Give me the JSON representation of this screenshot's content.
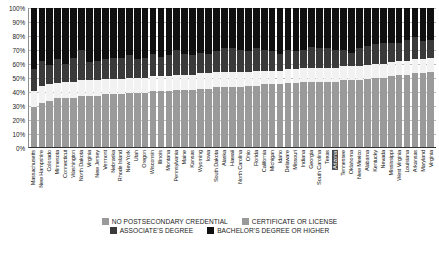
{
  "chart_data": {
    "type": "bar",
    "subtype": "100% stacked column",
    "title": "",
    "xlabel": "",
    "ylabel": "",
    "ylim": [
      0,
      100
    ],
    "ytick_labels": [
      "100%",
      "90%",
      "80%",
      "70%",
      "60%",
      "50%",
      "40%",
      "30%",
      "20%",
      "10%",
      "0%"
    ],
    "ytick_values": [
      100,
      90,
      80,
      70,
      60,
      50,
      40,
      30,
      20,
      10,
      0
    ],
    "grid": true,
    "legend_position": "bottom",
    "highlighted_category": "Arizona",
    "series": [
      {
        "name": "BACHELOR'S DEGREE OR HIGHER",
        "color": "#101010",
        "values": [
          44,
          38,
          41,
          37,
          40,
          36,
          30,
          39,
          38,
          37,
          36,
          36,
          34,
          37,
          36,
          33,
          35,
          34,
          30,
          33,
          34,
          32,
          33,
          31,
          29,
          29,
          30,
          31,
          29,
          30,
          31,
          33,
          30,
          31,
          30,
          28,
          29,
          29,
          30,
          30,
          32,
          29,
          27,
          26,
          25,
          25,
          25,
          23,
          21,
          24,
          23
        ]
      },
      {
        "name": "ASSOCIATE'S DEGREE",
        "color": "#3a3a3a",
        "values": [
          16,
          18,
          14,
          17,
          13,
          17,
          22,
          13,
          14,
          14,
          15,
          15,
          16,
          13,
          14,
          16,
          14,
          15,
          18,
          15,
          14,
          15,
          14,
          15,
          17,
          17,
          16,
          15,
          16,
          15,
          14,
          12,
          14,
          13,
          13,
          15,
          14,
          14,
          13,
          12,
          10,
          13,
          14,
          14,
          15,
          14,
          13,
          15,
          16,
          13,
          13
        ]
      },
      {
        "name": "CERTIFICATE OR LICENSE",
        "color": "#f2f2f2",
        "values": [
          11,
          12,
          12,
          11,
          12,
          12,
          11,
          11,
          11,
          11,
          11,
          11,
          11,
          11,
          11,
          11,
          11,
          11,
          11,
          11,
          11,
          11,
          11,
          11,
          11,
          11,
          11,
          10,
          11,
          10,
          10,
          10,
          10,
          10,
          10,
          10,
          10,
          10,
          10,
          10,
          10,
          10,
          10,
          10,
          10,
          10,
          10,
          10,
          10,
          10,
          10
        ]
      },
      {
        "name": "NO POSTSECONDARY CREDENTIAL",
        "color": "#9a9a9a",
        "values": [
          29,
          32,
          33,
          35,
          35,
          35,
          37,
          37,
          37,
          38,
          38,
          38,
          39,
          39,
          39,
          40,
          40,
          40,
          41,
          41,
          41,
          42,
          42,
          43,
          43,
          43,
          43,
          44,
          44,
          45,
          45,
          45,
          46,
          46,
          47,
          47,
          47,
          47,
          47,
          48,
          48,
          48,
          49,
          50,
          50,
          51,
          52,
          52,
          53,
          53,
          54
        ]
      }
    ],
    "categories": [
      "Massachusetts",
      "New Hampshire",
      "Colorado",
      "Minnesota",
      "Connecticut",
      "Washington",
      "North Dakota",
      "Virginia",
      "New Jersey",
      "Vermont",
      "Nebraska",
      "Rhode Island",
      "New York",
      "Utah",
      "Oregon",
      "Wisconsin",
      "Illinois",
      "Montana",
      "Pennsylvania",
      "Maine",
      "Kansas",
      "Wyoming",
      "Iowa",
      "South Dakota",
      "Alaska",
      "Hawaii",
      "North Carolina",
      "Ohio",
      "Florida",
      "California",
      "Michigan",
      "Idaho",
      "Delaware",
      "Missouri",
      "Indiana",
      "Georgia",
      "South Carolina",
      "Texas",
      "Arizona",
      "Tennessee",
      "Oklahoma",
      "New Mexico",
      "Alabama",
      "Kentucky",
      "Nevada",
      "Mississippi",
      "West Virginia",
      "Louisiana",
      "Arkansas",
      "Maryland",
      "Virginia"
    ]
  },
  "legend": {
    "rows": [
      [
        {
          "label": "NO POSTSECONDARY CREDENTIAL",
          "color": "#9a9a9a"
        },
        {
          "label": "CERTIFICATE OR LICENSE",
          "color": "#9a9a9a"
        }
      ],
      [
        {
          "label": "ASSOCIATE'S DEGREE",
          "color": "#3a3a3a"
        },
        {
          "label": "BACHELOR'S DEGREE OR HIGHER",
          "color": "#101010"
        }
      ]
    ]
  }
}
